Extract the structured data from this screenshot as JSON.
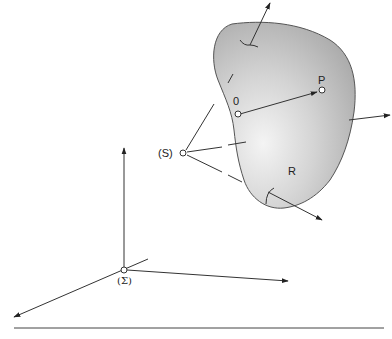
{
  "diagram": {
    "type": "rigid-body-frames",
    "colors": {
      "stroke": "#333333",
      "body_fill_light": "#f2f2f2",
      "body_fill_dark": "#a8a8a8",
      "body_outline": "#555555",
      "background": "#ffffff"
    },
    "labels": {
      "origin_body": "0",
      "point_p": "P",
      "observer_s": "(S)",
      "region_r": "R",
      "frame_sigma": "(Σ)"
    },
    "points": [
      {
        "id": "origin_body",
        "x": 238,
        "y": 114
      },
      {
        "id": "point_p",
        "x": 322,
        "y": 90
      },
      {
        "id": "observer_s",
        "x": 183,
        "y": 153
      },
      {
        "id": "frame_sigma",
        "x": 124,
        "y": 270
      }
    ]
  }
}
